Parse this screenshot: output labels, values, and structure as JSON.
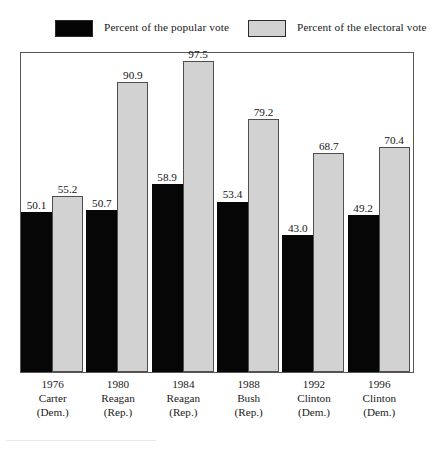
{
  "legend": {
    "items": [
      {
        "label": "Percent of the popular vote",
        "swatch_name": "legend-swatch-black",
        "color": "#050505"
      },
      {
        "label": "Percent of the electoral vote",
        "swatch_name": "legend-swatch-gray",
        "color": "#d2d2d2"
      }
    ]
  },
  "chart_data": {
    "type": "bar",
    "title": "",
    "subtitle": "",
    "xlabel": "",
    "ylabel": "",
    "ylim": [
      0,
      100
    ],
    "grid": false,
    "legend_position": "top",
    "categories": [
      "1976",
      "1980",
      "1984",
      "1988",
      "1992",
      "1996"
    ],
    "category_labels": [
      {
        "year": "1976",
        "candidate": "Carter",
        "party": "(Dem.)"
      },
      {
        "year": "1980",
        "candidate": "Reagan",
        "party": "(Rep.)"
      },
      {
        "year": "1984",
        "candidate": "Reagan",
        "party": "(Rep.)"
      },
      {
        "year": "1988",
        "candidate": "Bush",
        "party": "(Rep.)"
      },
      {
        "year": "1992",
        "candidate": "Clinton",
        "party": "(Dem.)"
      },
      {
        "year": "1996",
        "candidate": "Clinton",
        "party": "(Dem.)"
      }
    ],
    "series": [
      {
        "name": "Percent of the popular vote",
        "color": "#060606",
        "values": [
          50.1,
          50.7,
          58.9,
          53.4,
          43.0,
          49.2
        ],
        "value_labels": [
          "50.1",
          "50.7",
          "58.9",
          "53.4",
          "43.0",
          "49.2"
        ]
      },
      {
        "name": "Percent of the electoral vote",
        "color": "#d2d2d2",
        "values": [
          55.2,
          90.9,
          97.5,
          79.2,
          68.7,
          70.4
        ],
        "value_labels": [
          "55.2",
          "90.9",
          "97.5",
          "79.2",
          "68.7",
          "70.4"
        ]
      }
    ]
  }
}
